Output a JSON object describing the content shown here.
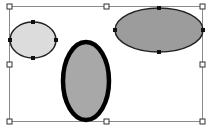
{
  "canvas": {
    "width": 208,
    "height": 128,
    "background": "#ffffff"
  },
  "selection_box": {
    "x1": 9,
    "y1": 6,
    "x2": 202,
    "y2": 121,
    "stroke": "#8a8a8a",
    "handle_size": 5,
    "handle_fill": "#ffffff",
    "handle_stroke": "#333333",
    "handles": [
      "top-left",
      "top-middle",
      "top-right",
      "middle-left",
      "middle-right",
      "bottom-left",
      "bottom-middle",
      "bottom-right"
    ]
  },
  "shapes": [
    {
      "id": "ellipse-small-left",
      "cx": 33,
      "cy": 40,
      "rx": 23,
      "ry": 18,
      "fill": "#dcdcdc",
      "stroke": "#222222",
      "stroke_width": 1.5,
      "selected": true
    },
    {
      "id": "ellipse-wide-right",
      "cx": 159,
      "cy": 30,
      "rx": 44,
      "ry": 22,
      "fill": "#9c9c9c",
      "stroke": "#222222",
      "stroke_width": 1.5,
      "selected": true
    },
    {
      "id": "ellipse-tall-middle",
      "cx": 86,
      "cy": 81,
      "rx": 23,
      "ry": 39,
      "fill": "#a8a8a8",
      "stroke": "#000000",
      "stroke_width": 4.5,
      "selected": false
    }
  ],
  "point_handle_size": 4,
  "point_handle_fill": "#111111"
}
